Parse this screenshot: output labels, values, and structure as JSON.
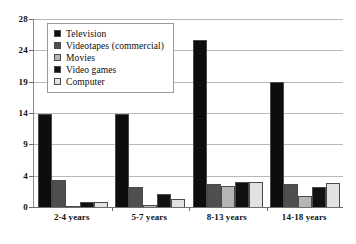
{
  "chart_data": {
    "type": "bar",
    "title": "",
    "subtitle": "",
    "xlabel": "",
    "ylabel": "",
    "categories": [
      "2-4 years",
      "5-7 years",
      "8-13 years",
      "14-18 years"
    ],
    "series": [
      {
        "name": "Television",
        "color": "#0d0d0d",
        "values": [
          13.8,
          13.9,
          25.3,
          19.0
        ]
      },
      {
        "name": "Videotapes (commercial)",
        "color": "#4f4f4f",
        "values": [
          3.4,
          2.5,
          3.0,
          3.0
        ]
      },
      {
        "name": "Movies",
        "color": "#b5b5b5",
        "values": [
          0.1,
          0.3,
          2.7,
          1.4
        ]
      },
      {
        "name": "Video games",
        "color": "#111111",
        "values": [
          0.6,
          1.6,
          3.2,
          2.5
        ]
      },
      {
        "name": "Computer",
        "color": "#e2e2e2",
        "values": [
          0.6,
          1.0,
          3.2,
          3.1
        ]
      }
    ],
    "yticks": [
      0,
      4,
      9,
      14,
      19,
      24,
      28
    ],
    "ytick_labels": [
      "0",
      "4",
      "9",
      "14",
      "19",
      "24",
      "28"
    ],
    "ylim": [
      0,
      28
    ],
    "grid": true,
    "legend_position": "upper-left",
    "annotations": []
  },
  "legend": {
    "items": [
      {
        "label": "Television"
      },
      {
        "label": "Videotapes (commercial)"
      },
      {
        "label": "Movies"
      },
      {
        "label": "Video games"
      },
      {
        "label": "Computer"
      }
    ]
  },
  "axes": {
    "y_tick_labels": [
      "28",
      "24",
      "19",
      "14",
      "9",
      "4",
      "0"
    ],
    "x_tick_labels": [
      "2-4 years",
      "5-7 years",
      "8-13 years",
      "14-18 years"
    ]
  },
  "colors": {
    "television": "#0d0d0d",
    "videotapes": "#4f4f4f",
    "movies": "#b5b5b5",
    "video_games": "#111111",
    "computer": "#e2e2e2",
    "gridline": "#b9b9b9",
    "axis": "#6e6e6e",
    "background": "#ffffff"
  }
}
